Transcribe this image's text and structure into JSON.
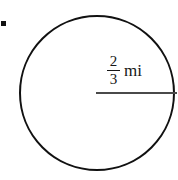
{
  "figure": {
    "type": "geometry-diagram",
    "shape": "circle",
    "background_color": "#ffffff",
    "outline_color": "#111111",
    "radius_line_color": "#4a4a4a",
    "label_color": "#161616",
    "bullet_color": "#111111"
  },
  "measurement": {
    "numerator": "2",
    "denominator": "3",
    "unit": "mi",
    "full_text": "2/3 mi",
    "applies_to": "radius"
  },
  "geometry": {
    "center_x": 97,
    "center_y": 93,
    "radius": 78,
    "circle_stroke_width": 2,
    "radius_line_stroke_width": 2,
    "radius_line_x1": 96,
    "radius_line_y1": 93,
    "radius_line_x2": 176,
    "radius_line_y2": 93
  },
  "bullet": {
    "x": 1,
    "y": 21,
    "size": 5
  }
}
